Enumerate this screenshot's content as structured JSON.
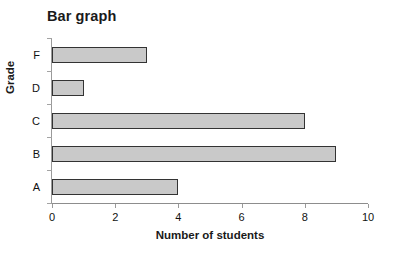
{
  "chart_data": {
    "type": "bar",
    "orientation": "horizontal",
    "title": "Bar graph",
    "xlabel": "Number of students",
    "ylabel": "Grade",
    "categories": [
      "A",
      "B",
      "C",
      "D",
      "F"
    ],
    "values": [
      4,
      9,
      8,
      1,
      3
    ],
    "category_order_top_to_bottom": [
      "F",
      "D",
      "C",
      "B",
      "A"
    ],
    "xlim": [
      0,
      10
    ],
    "xticks": [
      "0",
      "2",
      "4",
      "6",
      "8",
      "10"
    ],
    "xtick_values": [
      0,
      2,
      4,
      6,
      8,
      10
    ],
    "grid": false,
    "legend": false,
    "colors": {
      "bar_fill": "#c9c9c9",
      "bar_border": "#333333",
      "axis": "#9a9a9a",
      "text": "#111111",
      "background": "#ffffff"
    }
  }
}
